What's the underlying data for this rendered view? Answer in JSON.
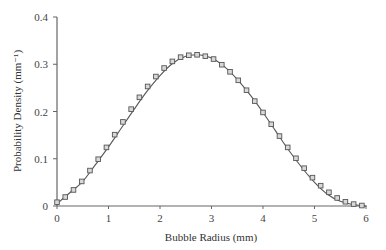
{
  "chart_data": {
    "type": "line",
    "title": "",
    "xlabel": "Bubble Radius (mm)",
    "ylabel": "Probability Density (mm⁻¹)",
    "xlim": [
      0,
      6
    ],
    "ylim": [
      0,
      0.4
    ],
    "xticks": [
      0,
      1,
      2,
      3,
      4,
      5,
      6
    ],
    "yticks": [
      0,
      0.1,
      0.2,
      0.3,
      0.4
    ],
    "ytick_labels": [
      "0",
      "0.1",
      "0.2",
      "0.3",
      "0.4"
    ],
    "xtick_labels": [
      "0",
      "1",
      "2",
      "3",
      "4",
      "5",
      "6"
    ],
    "grid": false,
    "legend": null,
    "series": [
      {
        "name": "fitted curve",
        "style": "line",
        "color": "#555555",
        "x": [
          0,
          0.25,
          0.5,
          0.75,
          1,
          1.25,
          1.5,
          1.75,
          2,
          2.25,
          2.5,
          2.75,
          3,
          3.25,
          3.5,
          3.75,
          4,
          4.25,
          4.5,
          4.75,
          5,
          5.25,
          5.5,
          5.75,
          6
        ],
        "values": [
          0.005,
          0.028,
          0.052,
          0.088,
          0.125,
          0.165,
          0.205,
          0.243,
          0.276,
          0.302,
          0.317,
          0.32,
          0.313,
          0.295,
          0.268,
          0.235,
          0.198,
          0.158,
          0.118,
          0.082,
          0.05,
          0.025,
          0.01,
          0.003,
          0.0
        ]
      },
      {
        "name": "data points",
        "style": "square-markers",
        "color": "#555555",
        "x": [
          0,
          0.16,
          0.32,
          0.48,
          0.64,
          0.8,
          0.96,
          1.12,
          1.28,
          1.44,
          1.6,
          1.76,
          1.92,
          2.08,
          2.24,
          2.4,
          2.56,
          2.72,
          2.88,
          3.04,
          3.2,
          3.36,
          3.52,
          3.68,
          3.84,
          4.0,
          4.16,
          4.32,
          4.48,
          4.64,
          4.8,
          4.96,
          5.12,
          5.28,
          5.44,
          5.6,
          5.76,
          5.92
        ],
        "values": [
          0.008,
          0.019,
          0.034,
          0.052,
          0.075,
          0.099,
          0.124,
          0.151,
          0.178,
          0.205,
          0.23,
          0.253,
          0.274,
          0.292,
          0.306,
          0.315,
          0.319,
          0.32,
          0.317,
          0.311,
          0.299,
          0.284,
          0.266,
          0.245,
          0.222,
          0.198,
          0.173,
          0.148,
          0.124,
          0.101,
          0.08,
          0.06,
          0.043,
          0.029,
          0.017,
          0.009,
          0.004,
          0.001
        ]
      }
    ]
  }
}
